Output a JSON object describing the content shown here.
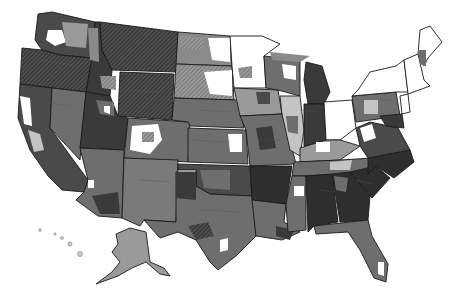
{
  "map": {
    "title": "",
    "type": "choropleth",
    "palette": {
      "darkest": "#2e2e2e",
      "dark": "#4a4a4a",
      "mid": "#6e6e6e",
      "light": "#9a9a9a",
      "lighter": "#c4c4c4",
      "none": "#ffffff",
      "hatched": "#5a5a5a"
    },
    "legend": []
  }
}
